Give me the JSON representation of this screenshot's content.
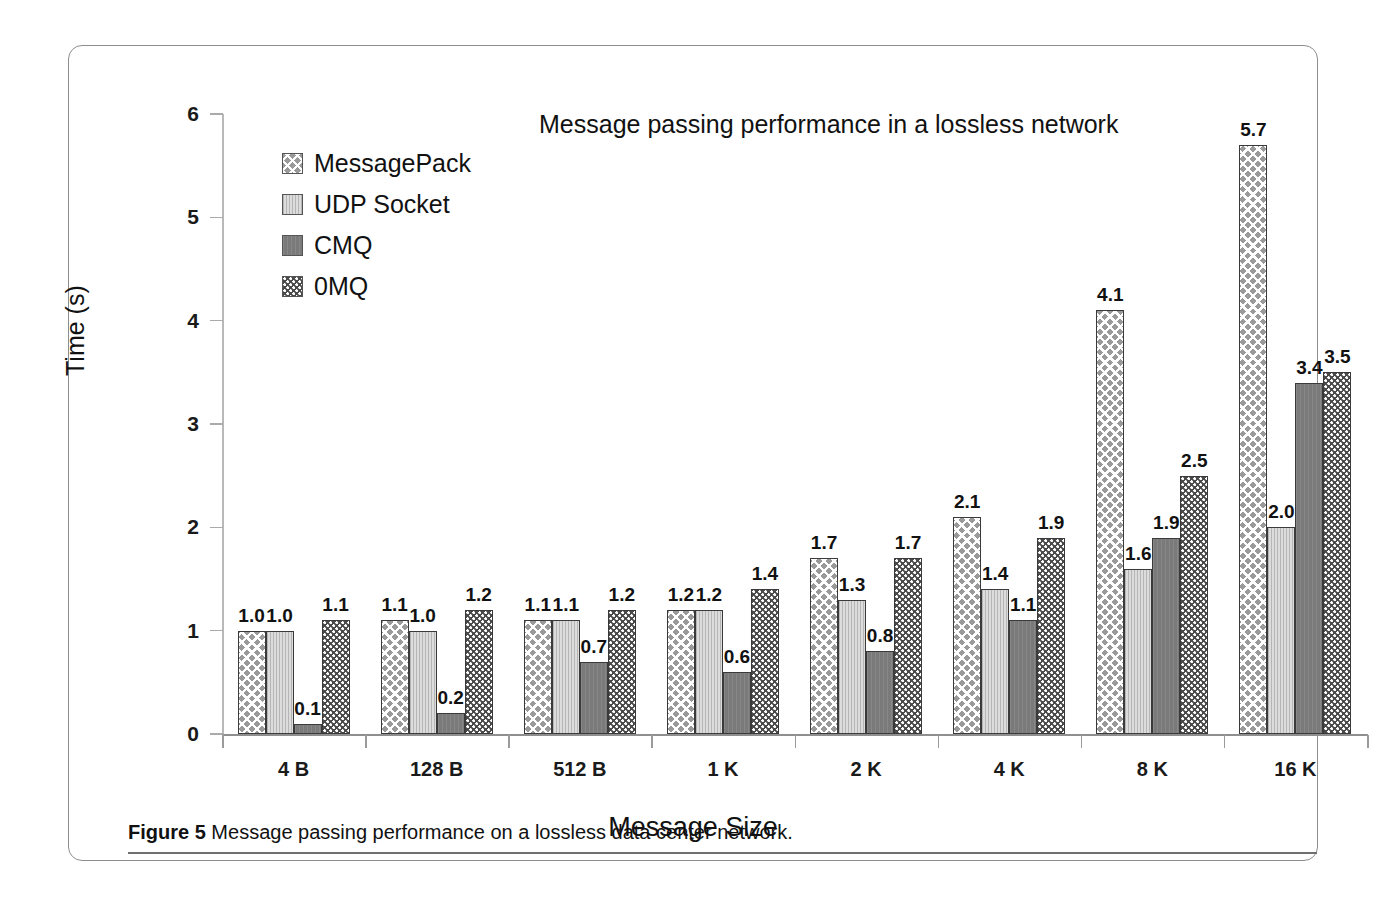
{
  "figure": {
    "caption_prefix": "Figure 5",
    "caption_text": "Message passing performance on a lossless data center network."
  },
  "chart_data": {
    "type": "bar",
    "title": "Message passing performance in a lossless network",
    "xlabel": "Message Size",
    "ylabel": "Time (s)",
    "ylim": [
      0,
      6
    ],
    "yticks": [
      0,
      1,
      2,
      3,
      4,
      5,
      6
    ],
    "grid": false,
    "legend_position": "upper-left-inside",
    "categories": [
      "4 B",
      "128 B",
      "512 B",
      "1 K",
      "2 K",
      "4 K",
      "8 K",
      "16 K"
    ],
    "series": [
      {
        "name": "MessagePack",
        "pattern": "diagonal-cross-hatch",
        "color": "#9a9a9a",
        "values": [
          1.0,
          1.1,
          1.1,
          1.2,
          1.7,
          2.1,
          4.1,
          5.7
        ],
        "labels": [
          "1.0",
          "1.1",
          "1.1",
          "1.2",
          "1.7",
          "2.1",
          "4.1",
          "5.7"
        ]
      },
      {
        "name": "UDP Socket",
        "pattern": "light-vertical-texture",
        "color": "#dcdcdc",
        "values": [
          1.0,
          1.0,
          1.1,
          1.2,
          1.3,
          1.4,
          1.6,
          2.0
        ],
        "labels": [
          "1.0",
          "1.0",
          "1.1",
          "1.2",
          "1.3",
          "1.4",
          "1.6",
          "2.0"
        ]
      },
      {
        "name": "CMQ",
        "pattern": "solid-gray",
        "color": "#7a7a7a",
        "values": [
          0.1,
          0.2,
          0.7,
          0.6,
          0.8,
          1.1,
          1.9,
          3.4
        ],
        "labels": [
          "0.1",
          "0.2",
          "0.7",
          "0.6",
          "0.8",
          "1.1",
          "1.9",
          "3.4"
        ]
      },
      {
        "name": "0MQ",
        "pattern": "dark-speckled-dots",
        "color": "#4a4a4a",
        "values": [
          1.1,
          1.2,
          1.2,
          1.4,
          1.7,
          1.9,
          2.5,
          3.5
        ],
        "labels": [
          "1.1",
          "1.2",
          "1.2",
          "1.4",
          "1.7",
          "1.9",
          "2.5",
          "3.5"
        ]
      }
    ]
  }
}
